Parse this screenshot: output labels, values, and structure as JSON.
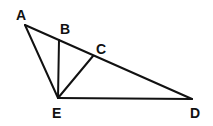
{
  "diagram": {
    "type": "geometry",
    "points": {
      "A": {
        "label": "A",
        "x": 25,
        "y": 25,
        "lx": 16,
        "ly": 20
      },
      "B": {
        "label": "B",
        "x": 59,
        "y": 40,
        "lx": 60,
        "ly": 34
      },
      "C": {
        "label": "C",
        "x": 93,
        "y": 56,
        "lx": 96,
        "ly": 54
      },
      "D": {
        "label": "D",
        "x": 192,
        "y": 99,
        "lx": 190,
        "ly": 118
      },
      "E": {
        "label": "E",
        "x": 58,
        "y": 98,
        "lx": 52,
        "ly": 118
      }
    },
    "segments": [
      [
        "A",
        "D"
      ],
      [
        "A",
        "E"
      ],
      [
        "E",
        "D"
      ],
      [
        "B",
        "E"
      ],
      [
        "C",
        "E"
      ]
    ],
    "stroke_color": "#111111"
  }
}
